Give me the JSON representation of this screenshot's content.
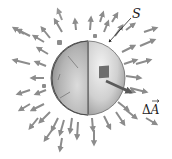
{
  "diagram": {
    "type": "gaussian-surface-flux",
    "labels": {
      "surface": "S",
      "area_delta": "Δ",
      "area_symbol": "A"
    },
    "colors": {
      "background": "#ffffff",
      "arrow": "#8c8c8c",
      "sphere_outer_light": "#e6e6e6",
      "sphere_outer_dark": "#a8a8a8",
      "sphere_inner_light": "#d2d2d2",
      "sphere_inner_dark": "#8f8f8f",
      "outline": "#555555",
      "area_element": "#6e6e6e",
      "text": "#222222"
    },
    "sphere": {
      "cx": 86,
      "cy": 78,
      "r": 37
    }
  }
}
